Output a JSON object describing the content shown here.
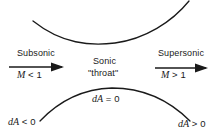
{
  "figure": {
    "background_color": "#ffffff",
    "ink_color": "#1a1a1a",
    "width": 222,
    "height": 138
  },
  "walls": {
    "upper_wall_name": "upper nozzle wall",
    "lower_wall_name": "lower nozzle wall",
    "upper_path": "M 33 21 C 62 44, 90 46, 115 43 C 145 39, 172 22, 189 1",
    "lower_path": "M 40 121 C 58 102, 80 89, 112 88 C 146 88, 172 103, 190 121",
    "stroke_width": 1.3
  },
  "arrows": {
    "subsonic": {
      "name": "subsonic-flow-arrow",
      "x1": 9,
      "y1": 67,
      "x2": 62,
      "y2": 67,
      "head": "63,67 52,63.4 52,70.6"
    },
    "supersonic": {
      "name": "supersonic-flow-arrow",
      "x1": 155,
      "y1": 68,
      "x2": 207,
      "y2": 68,
      "head": "208,68 197,64.4 197,71.6"
    },
    "stroke_width": 1.6
  },
  "labels": {
    "subsonic": "Subsonic",
    "subsonic_mach_var": "M",
    "subsonic_mach_rel": " < 1",
    "sonic": "Sonic",
    "throat": "\"throat\"",
    "supersonic": "Supersonic",
    "supersonic_mach_var": "M",
    "supersonic_mach_rel": " > 1",
    "da_negative_var": "dA",
    "da_negative_rel": " < 0",
    "da_zero_var": "dA",
    "da_zero_rel": " = 0",
    "da_positive_var": "dA",
    "da_positive_rel": " > 0"
  }
}
